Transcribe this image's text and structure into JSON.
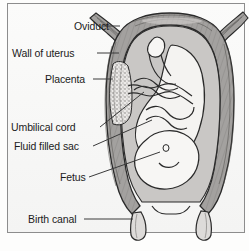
{
  "figure": {
    "labels": [
      {
        "id": "oviduct",
        "text": "Oviduct"
      },
      {
        "id": "wall-uterus",
        "text": "Wall of uterus"
      },
      {
        "id": "placenta",
        "text": "Placenta"
      },
      {
        "id": "umbilical",
        "text": "Umbilical cord"
      },
      {
        "id": "fluid-sac",
        "text": "Fluid filled sac"
      },
      {
        "id": "fetus",
        "text": "Fetus"
      },
      {
        "id": "birth-canal",
        "text": "Birth canal"
      }
    ]
  },
  "colors": {
    "background": "#f8f8f7",
    "frame_border": "#8d8d8d",
    "text": "#1b1b1b",
    "leader_line": "#3a3a3a",
    "uterus_wall_fill": "#9c9a98",
    "uterus_wall_stroke": "#2f2f2f",
    "fluid_sac_fill": "#c9c7c5",
    "fetus_fill": "#f4f3f1",
    "placenta_fill": "#e9e8e6",
    "outline": "#2a2a2a"
  }
}
